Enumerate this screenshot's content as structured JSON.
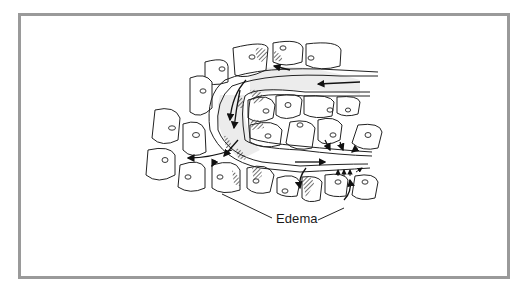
{
  "figure": {
    "type": "cell-tissue-diagram",
    "label": "Edema",
    "border_color": "#9a9a9a",
    "line_color": "#1a1a1a",
    "hatch_color": "#444444",
    "fluid_shading_color": "#e6e6e6"
  }
}
